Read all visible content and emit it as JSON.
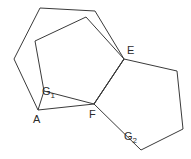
{
  "figure": {
    "background_color": "#ffffff",
    "stroke_color": "#3a3a3a",
    "label_color": "#2b2b2b",
    "canvas": {
      "width": 191,
      "height": 159
    },
    "shapes": [
      {
        "name": "outer-hexagon",
        "type": "polygon",
        "closed": true,
        "points": "40,8 95,11 124,59 94,104 38,110 14,59"
      },
      {
        "name": "left-pentagon",
        "type": "polygon",
        "closed": true,
        "points": "86,17 124,59 94,104 44,91 35,41"
      },
      {
        "name": "right-pentagon",
        "type": "polygon",
        "closed": true,
        "points": "124,59 177,71 183,129 141,150 94,104"
      },
      {
        "name": "segment-a-to-g1",
        "type": "polyline",
        "closed": false,
        "points": "38,110 44,91"
      }
    ],
    "labels": [
      {
        "name": "label-E",
        "text": "E",
        "sub": "",
        "x": 127,
        "y": 45
      },
      {
        "name": "label-G1",
        "text": "G",
        "sub": "1",
        "x": 42,
        "y": 86
      },
      {
        "name": "label-A",
        "text": "A",
        "sub": "",
        "x": 33,
        "y": 114
      },
      {
        "name": "label-F",
        "text": "F",
        "sub": "",
        "x": 89,
        "y": 109
      },
      {
        "name": "label-G2",
        "text": "G",
        "sub": "2",
        "x": 124,
        "y": 131
      }
    ]
  }
}
